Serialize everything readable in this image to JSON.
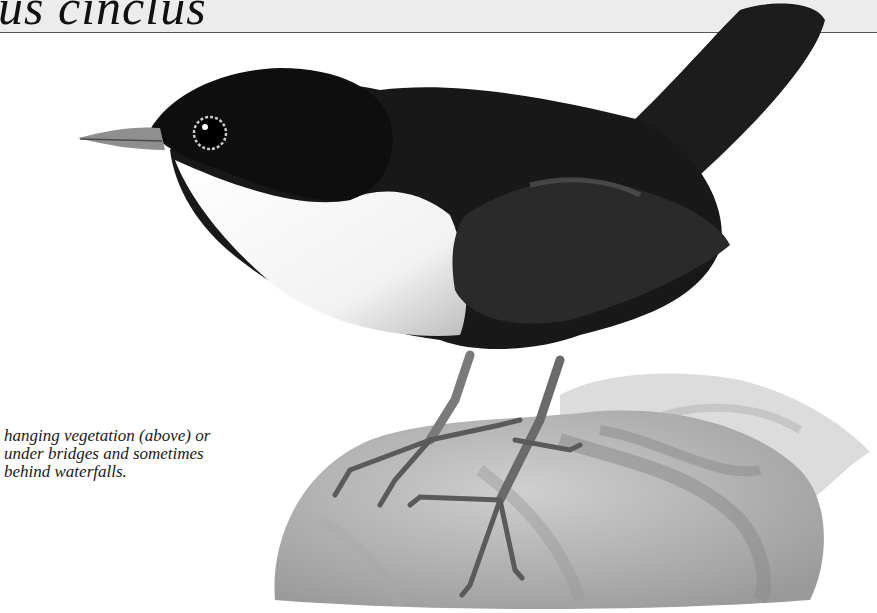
{
  "page": {
    "title_fragment": "us cinclus",
    "colors": {
      "band_background": "#ececec",
      "band_rule": "#555555",
      "ink": "#111111"
    }
  },
  "caption": {
    "lines": [
      "hanging vegetation (above) or",
      "under bridges and sometimes",
      "behind waterfalls."
    ]
  },
  "illustration": {
    "subject": "dipper-bird-on-rock"
  }
}
